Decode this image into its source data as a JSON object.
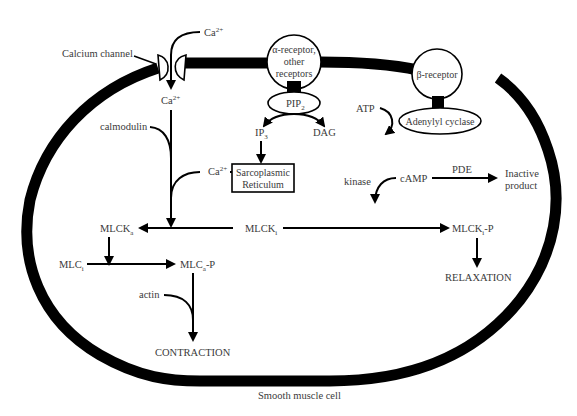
{
  "figure": {
    "caption": "Smooth muscle cell",
    "colors": {
      "stroke": "#000000",
      "text": "#3a3a3a",
      "background": "#ffffff"
    }
  },
  "membrane": {
    "calcium_channel_label": "Calcium channel",
    "ca_outside": {
      "base": "Ca",
      "sup": "2+"
    },
    "ca_inside": {
      "base": "Ca",
      "sup": "2+"
    }
  },
  "alpha_pathway": {
    "receptor_lines": [
      "α-receptor,",
      "other",
      "receptors"
    ],
    "pip2": {
      "base": "PIP",
      "sub": "2"
    },
    "ip3": {
      "base": "IP",
      "sub": "3"
    },
    "dag": "DAG",
    "sr_lines": [
      "Sarcoplasmic",
      "Reticulum"
    ],
    "ca_sr": {
      "base": "Ca",
      "sup": "2+"
    },
    "calmodulin": "calmodulin"
  },
  "beta_pathway": {
    "receptor": "β-receptor",
    "adenylyl_cyclase": "Adenylyl cyclase",
    "atp": "ATP",
    "camp": "cAMP",
    "pde": "PDE",
    "inactive_lines": [
      "Inactive",
      "product"
    ],
    "kinase": "kinase"
  },
  "mlck": {
    "mlck_a": {
      "base": "MLCK",
      "sub": "a"
    },
    "mlck_i": {
      "base": "MLCK",
      "sub": "i"
    },
    "mlck_i_p": {
      "base": "MLCK",
      "sub": "i",
      "suffix": "-P"
    },
    "mlc_i": {
      "base": "MLC",
      "sub": "i"
    },
    "mlc_a_p": {
      "base": "MLC",
      "sub": "a",
      "suffix": "-P"
    },
    "actin": "actin",
    "contraction": "CONTRACTION",
    "relaxation": "RELAXATION"
  }
}
